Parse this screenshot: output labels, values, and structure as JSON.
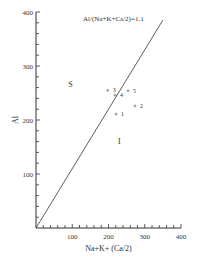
{
  "chart_data": {
    "type": "scatter",
    "title": "",
    "xlabel": "Na+K+ (Ca/2)",
    "ylabel": "Al",
    "xlim": [
      0,
      400
    ],
    "ylim": [
      0,
      400
    ],
    "x_ticks": [
      100,
      200,
      300,
      400
    ],
    "y_ticks": [
      100,
      200,
      300,
      400
    ],
    "minor_tick_step": 20,
    "grid": false,
    "points": [
      {
        "label": "1",
        "x": 221,
        "y": 211
      },
      {
        "label": "2",
        "x": 273,
        "y": 226
      },
      {
        "label": "3",
        "x": 198,
        "y": 255
      },
      {
        "label": "4",
        "x": 218,
        "y": 246
      },
      {
        "label": "5",
        "x": 254,
        "y": 254
      }
    ],
    "reference_line": {
      "label": "Al/(Na+K+Ca/2)=1.1",
      "slope": 1.1,
      "from": [
        0,
        0
      ],
      "to": [
        350,
        385
      ]
    },
    "region_labels": [
      {
        "text": "S",
        "x": 95,
        "y": 262
      },
      {
        "text": "I",
        "x": 230,
        "y": 155
      }
    ]
  }
}
